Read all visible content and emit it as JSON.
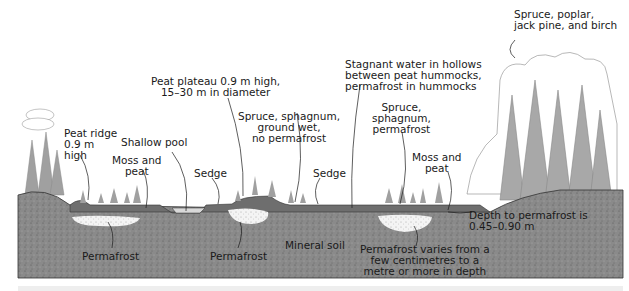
{
  "diagram": {
    "type": "cross-section",
    "colors": {
      "mineral_soil": "#8a8a8a",
      "peat_layer": "#6e6e6e",
      "permafrost": "#f2f2f2",
      "pool": "#d9d9d9",
      "trees": "#9a9a9a",
      "line": "#1a1a1a"
    },
    "labels": {
      "peat_ridge": "Peat ridge\n0.9 m\nhigh",
      "shallow_pool": "Shallow pool",
      "moss_peat_left": "Moss and\npeat",
      "sedge_left": "Sedge",
      "peat_plateau": "Peat plateau 0.9 m high,\n15–30 m in diameter",
      "spruce_wet": "Spruce, sphagnum,\nground wet,\nno permafrost",
      "sedge_right": "Sedge",
      "stagnant_water": "Stagnant water in hollows\nbetween peat hummocks,\npermafrost in hummocks",
      "spruce_permafrost": "Spruce,\nsphagnum,\npermafrost",
      "moss_peat_right": "Moss and\npeat",
      "forest": "Spruce, poplar,\njack pine, and birch",
      "permafrost_left": "Permafrost",
      "permafrost_mid": "Permafrost",
      "mineral_soil": "Mineral soil",
      "permafrost_varies": "Permafrost varies from a\nfew centimetres to a\nmetre or more in depth",
      "depth_to_permafrost": "Depth to permafrost is\n0.45–0.90 m"
    }
  }
}
